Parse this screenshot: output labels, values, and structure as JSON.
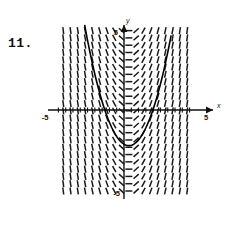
{
  "problem": {
    "number_label": "11."
  },
  "figure": {
    "name": "slope-field-with-solution-curve",
    "axis_labels": {
      "x": "x",
      "y": "y"
    },
    "tick_labels": {
      "x_left": "-5",
      "x_right": "5",
      "y_top": "5",
      "y_bottom": "-5"
    },
    "colors": {
      "axis": "#111111",
      "field": "#1a1a1a",
      "curve": "#000000",
      "background": "#ffffff"
    }
  },
  "chart_data": {
    "type": "line",
    "title": "",
    "subtitle": "",
    "xlabel": "x",
    "ylabel": "y",
    "xlim": [
      -5,
      5
    ],
    "ylim": [
      -5,
      5
    ],
    "xticks": [
      -5,
      5
    ],
    "yticks": [
      -5,
      5
    ],
    "xticklabels": [
      "-5",
      "5"
    ],
    "yticklabels": [
      "-5",
      "5"
    ],
    "grid": false,
    "legend": null,
    "annotations": [
      "11."
    ],
    "field": {
      "kind": "slope-field",
      "description": "Short dash segments on a regular grid; slope depends only on x, zero near x = 0.3, negative for smaller x, positive for larger x.",
      "slope_formula": "dy/dx = 2*(x - 0.3)",
      "x_range": [
        -4.2,
        4.2
      ],
      "y_range": [
        -5.0,
        5.0
      ],
      "x_step": 0.45,
      "y_step": 0.45,
      "dash_length_px": 7,
      "sample_slopes": [
        {
          "x": -4.2,
          "slope": -9.0
        },
        {
          "x": -3.0,
          "slope": -6.6
        },
        {
          "x": -2.0,
          "slope": -4.6
        },
        {
          "x": -1.0,
          "slope": -2.6
        },
        {
          "x": 0.3,
          "slope": 0.0
        },
        {
          "x": 1.0,
          "slope": 1.4
        },
        {
          "x": 2.0,
          "slope": 3.4
        },
        {
          "x": 3.0,
          "slope": 5.4
        },
        {
          "x": 4.2,
          "slope": 7.8
        }
      ]
    },
    "series": [
      {
        "name": "solution curve",
        "type": "parabola",
        "equation": "y = (x - 0.3)^2 - 2.2",
        "vertex": [
          0.3,
          -2.2
        ],
        "x_intercepts": [
          -1.18,
          1.78
        ],
        "x": [
          -2.5,
          -2.25,
          -2.0,
          -1.75,
          -1.5,
          -1.25,
          -1.0,
          -0.75,
          -0.5,
          -0.25,
          0.0,
          0.25,
          0.5,
          0.75,
          1.0,
          1.25,
          1.5,
          1.75,
          2.0,
          2.25,
          2.5,
          2.75
        ],
        "values": [
          5.64,
          4.3,
          3.09,
          2.0,
          1.04,
          0.2,
          -0.51,
          -1.1,
          -1.56,
          -1.9,
          -2.11,
          -2.2,
          -2.16,
          -2.0,
          -1.71,
          -1.3,
          -0.76,
          -0.1,
          0.69,
          1.6,
          2.64,
          3.8
        ]
      }
    ]
  }
}
